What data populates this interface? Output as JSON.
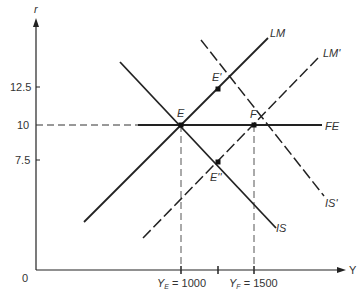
{
  "diagram": {
    "axes": {
      "y_label": "r",
      "x_label": "Y",
      "origin_label": "0",
      "y_ticks": [
        {
          "label": "12.5",
          "value": 12.5
        },
        {
          "label": "10",
          "value": 10
        },
        {
          "label": "7.5",
          "value": 7.5
        }
      ],
      "x_ticks": [
        {
          "label_main": "Y",
          "label_sub": "E",
          "label_rest": " = 1000",
          "value": 1000
        },
        {
          "label_main": "",
          "label_sub": "",
          "label_rest": "",
          "value": 1250
        },
        {
          "label_main": "Y",
          "label_sub": "F",
          "label_rest": " = 1500",
          "value": 1500
        }
      ]
    },
    "curves": [
      {
        "name": "LM",
        "style": "solid"
      },
      {
        "name": "LM'",
        "style": "dashed"
      },
      {
        "name": "IS",
        "style": "solid"
      },
      {
        "name": "IS'",
        "style": "dashed"
      },
      {
        "name": "FE",
        "style": "solid"
      }
    ],
    "points": [
      {
        "name": "E",
        "Y": 1000,
        "r": 10
      },
      {
        "name": "F",
        "Y": 1500,
        "r": 10
      },
      {
        "name": "E'",
        "Y": 1250,
        "r": 12.5
      },
      {
        "name": "E''",
        "Y": 1250,
        "r": 7.5
      }
    ],
    "colors": {
      "line": "#222222",
      "text": "#333333"
    }
  }
}
